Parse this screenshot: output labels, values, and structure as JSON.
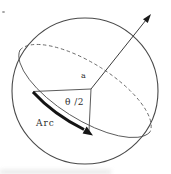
{
  "figure": {
    "type": "spherical-geometry-diagram",
    "labels": {
      "center_point": "a",
      "half_angle": "θ /2",
      "arc": "Arc"
    },
    "colors": {
      "line": "#4a4a4a",
      "thick_arc": "#141414",
      "text": "#2e2e2e",
      "background": "#ffffff"
    }
  }
}
